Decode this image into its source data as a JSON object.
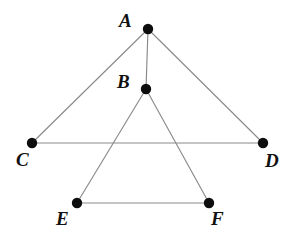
{
  "figure": {
    "background_color": "#ffffff",
    "line_color": "#8a8a8a",
    "dot_color": "#0d0d0d",
    "label_color": "#111111",
    "dot_radius": 5.2,
    "line_width": 1.15
  },
  "points": [
    {
      "name": "A",
      "label": "A",
      "x": 148,
      "y": 29,
      "label_x": 119,
      "label_y": 27
    },
    {
      "name": "B",
      "label": "B",
      "x": 146,
      "y": 89,
      "label_x": 117,
      "label_y": 88
    },
    {
      "name": "C",
      "label": "C",
      "x": 32,
      "y": 143,
      "label_x": 16,
      "label_y": 166
    },
    {
      "name": "D",
      "label": "D",
      "x": 263,
      "y": 143,
      "label_x": 265,
      "label_y": 167
    },
    {
      "name": "E",
      "label": "E",
      "x": 77,
      "y": 203,
      "label_x": 56,
      "label_y": 225
    },
    {
      "name": "F",
      "label": "F",
      "x": 209,
      "y": 203,
      "label_x": 211,
      "label_y": 225
    }
  ],
  "segments": [
    {
      "name": "segment-AC",
      "from": "A",
      "to": "C",
      "x1": 148,
      "y1": 29,
      "x2": 32,
      "y2": 143
    },
    {
      "name": "segment-AD",
      "from": "A",
      "to": "D",
      "x1": 148,
      "y1": 29,
      "x2": 263,
      "y2": 143
    },
    {
      "name": "segment-AB",
      "from": "A",
      "to": "B",
      "x1": 148,
      "y1": 29,
      "x2": 146,
      "y2": 89
    },
    {
      "name": "segment-CD",
      "from": "C",
      "to": "D",
      "x1": 32,
      "y1": 143,
      "x2": 263,
      "y2": 143
    },
    {
      "name": "segment-BE",
      "from": "B",
      "to": "E",
      "x1": 146,
      "y1": 89,
      "x2": 77,
      "y2": 203
    },
    {
      "name": "segment-BF",
      "from": "B",
      "to": "F",
      "x1": 146,
      "y1": 89,
      "x2": 209,
      "y2": 203
    },
    {
      "name": "segment-EF",
      "from": "E",
      "to": "F",
      "x1": 77,
      "y1": 203,
      "x2": 209,
      "y2": 203
    }
  ]
}
